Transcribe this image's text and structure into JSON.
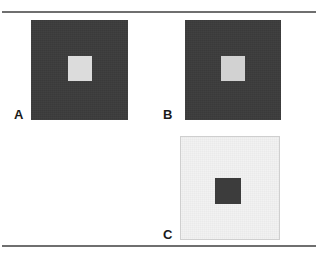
{
  "figure": {
    "background_color": "#ffffff",
    "rule_color": "#6f6f6f",
    "rules": [
      {
        "name": "top-rule",
        "y": 11
      },
      {
        "name": "bottom-rule",
        "y": 245
      }
    ]
  },
  "panels": [
    {
      "label": "A",
      "surround_color": "#3c3c3c",
      "surround_name": "dark-surround",
      "target_color": "#dcdcdc",
      "target_name": "light-target",
      "description": "Light gray square on dark gray surround"
    },
    {
      "label": "B",
      "surround_color": "#3c3c3c",
      "surround_name": "dark-surround",
      "target_color": "#d2d2d2",
      "target_name": "light-target",
      "description": "Slightly darker light gray square on dark gray surround"
    },
    {
      "label": "C",
      "surround_color": "#f2f2f2",
      "surround_name": "light-surround",
      "target_color": "#3c3c3c",
      "target_name": "dark-target",
      "description": "Dark gray square on light gray surround"
    }
  ]
}
